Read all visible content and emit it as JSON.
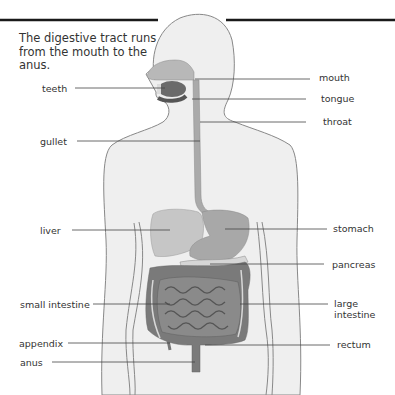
{
  "caption": "The digestive tract runs from the mouth to the anus.",
  "labels": {
    "left": [
      {
        "id": "teeth",
        "text": "teeth"
      },
      {
        "id": "gullet",
        "text": "gullet"
      },
      {
        "id": "liver",
        "text": "liver"
      },
      {
        "id": "small_intestine",
        "text": "small intestine"
      },
      {
        "id": "appendix",
        "text": "appendix"
      },
      {
        "id": "anus",
        "text": "anus"
      }
    ],
    "right": [
      {
        "id": "mouth",
        "text": "mouth"
      },
      {
        "id": "tongue",
        "text": "tongue"
      },
      {
        "id": "throat",
        "text": "throat"
      },
      {
        "id": "stomach",
        "text": "stomach"
      },
      {
        "id": "pancreas",
        "text": "pancreas"
      },
      {
        "id": "large_intestine",
        "text": "large intestine"
      },
      {
        "id": "rectum",
        "text": "rectum"
      }
    ]
  },
  "colors": {
    "body_fill": "#efefef",
    "body_outline": "#888888",
    "organ_dark": "#6a6a6a",
    "organ_mid": "#9a9a9a",
    "organ_light": "#c4c4c4",
    "rule": "#1a1a1a",
    "leader": "#444444"
  }
}
